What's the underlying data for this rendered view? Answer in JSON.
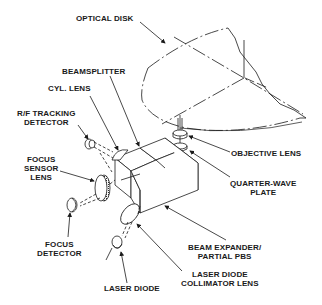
{
  "diagram": {
    "type": "optical pickup assembly (exploded isometric)",
    "labels": {
      "optical_disk": "OPTICAL DISK",
      "beamsplitter": "BEAMSPLITTER",
      "cyl_lens": "CYL. LENS",
      "rf_tracking_detector_1": "R/F TRACKING",
      "rf_tracking_detector_2": "DETECTOR",
      "focus_sensor_lens_1": "FOCUS",
      "focus_sensor_lens_2": "SENSOR",
      "focus_sensor_lens_3": "LENS",
      "objective_lens": "OBJECTIVE LENS",
      "quarter_wave_plate_1": "QUARTER-WAVE",
      "quarter_wave_plate_2": "PLATE",
      "focus_detector_1": "FOCUS",
      "focus_detector_2": "DETECTOR",
      "beam_expander_1": "BEAM EXPANDER/",
      "beam_expander_2": "PARTIAL PBS",
      "laser_diode": "LASER DIODE",
      "collimator_1": "LASER DIODE",
      "collimator_2": "COLLIMATOR LENS"
    },
    "colors": {
      "line": "#1a1a1a",
      "background": "#ffffff"
    }
  }
}
